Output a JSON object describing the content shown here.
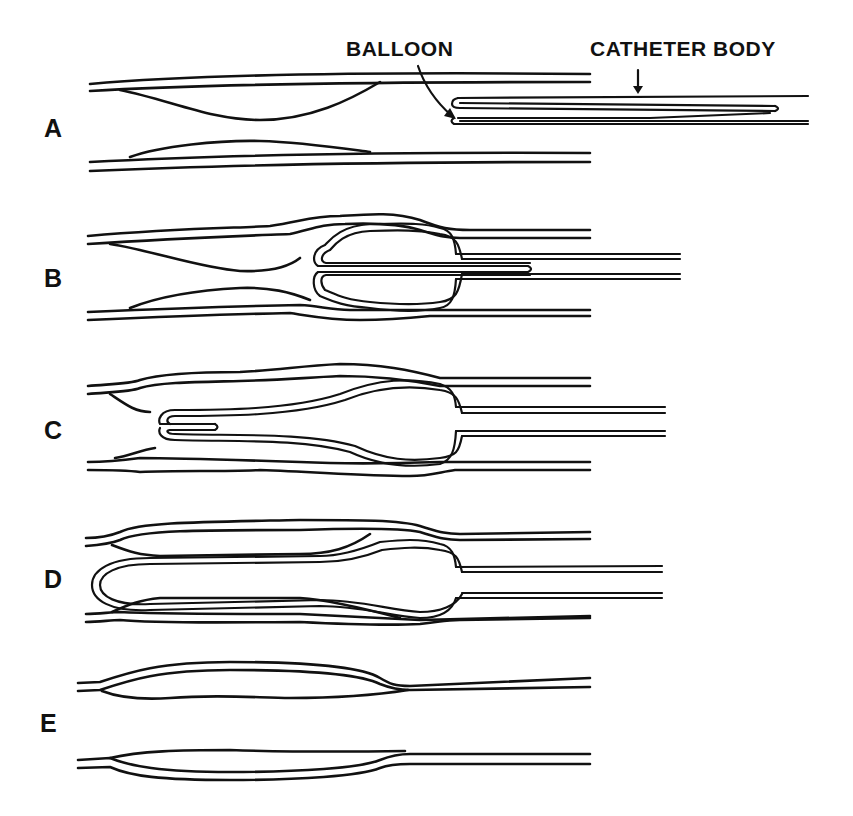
{
  "figure": {
    "callouts": {
      "balloon": "BALLOON",
      "catheter_body": "CATHETER BODY"
    },
    "panels": [
      {
        "id": "A",
        "label": "A",
        "description": "Vessel with lesion; catheter with inverted balloon approaching"
      },
      {
        "id": "B",
        "label": "B",
        "description": "Balloon begins to evert into vessel lumen"
      },
      {
        "id": "C",
        "label": "C",
        "description": "Balloon further everted, pressing lesion against wall"
      },
      {
        "id": "D",
        "label": "D",
        "description": "Balloon fully everted across lesion"
      },
      {
        "id": "E",
        "label": "E",
        "description": "Vessel after treatment with lesion compressed"
      }
    ],
    "colors": {
      "ink": "#111111",
      "background": "#ffffff"
    }
  }
}
